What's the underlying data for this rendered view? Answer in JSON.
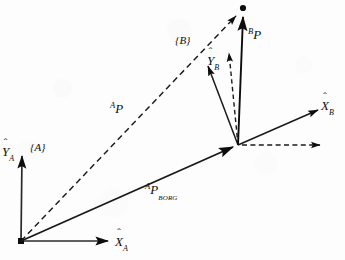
{
  "figure": {
    "background_color": "#fdfdfd",
    "ink_color": "#0d0d0d",
    "width": 345,
    "height": 260
  },
  "frames": {
    "A": {
      "tag": "{A}",
      "origin": {
        "x": 21,
        "y": 241
      },
      "x_axis": {
        "symbol": "X",
        "hat": "̂",
        "subscript": "A",
        "tip": {
          "x": 112,
          "y": 241
        },
        "label_pos": {
          "x": 116,
          "y": 234
        }
      },
      "y_axis": {
        "symbol": "Y",
        "hat": "̂",
        "subscript": "A",
        "tip": {
          "x": 22,
          "y": 152
        },
        "label_pos": {
          "x": 3,
          "y": 150
        }
      },
      "tag_pos": {
        "x": 30,
        "y": 148
      }
    },
    "B": {
      "tag": "{B}",
      "origin": {
        "x": 238,
        "y": 145
      },
      "x_axis": {
        "symbol": "X",
        "hat": "̂",
        "subscript": "B",
        "tip": {
          "x": 322,
          "y": 108
        },
        "label_pos": {
          "x": 322,
          "y": 98
        }
      },
      "y_axis": {
        "symbol": "Y",
        "hat": "̂",
        "subscript": "B",
        "tip": {
          "x": 206,
          "y": 62
        },
        "label_pos": {
          "x": 208,
          "y": 54
        }
      },
      "tag_pos": {
        "x": 176,
        "y": 36
      }
    }
  },
  "point_p": {
    "name": "P",
    "pos": {
      "x": 243,
      "y": 8
    },
    "marker": "filled-dot"
  },
  "vectors": [
    {
      "id": "A_P",
      "style": "dashed",
      "presuperscript": "A",
      "symbol": "P",
      "subscript": "",
      "from": {
        "x": 21,
        "y": 241
      },
      "to": {
        "x": 240,
        "y": 12
      },
      "label_pos": {
        "x": 112,
        "y": 103
      }
    },
    {
      "id": "B_P",
      "style": "solid",
      "presuperscript": "B",
      "symbol": "P",
      "subscript": "",
      "from": {
        "x": 238,
        "y": 145
      },
      "to": {
        "x": 244,
        "y": 13
      },
      "label_pos": {
        "x": 249,
        "y": 29
      }
    },
    {
      "id": "A_P_BORG",
      "style": "solid",
      "presuperscript": "A",
      "symbol": "P",
      "subscript": "BORG",
      "from": {
        "x": 21,
        "y": 241
      },
      "to": {
        "x": 238,
        "y": 145
      },
      "label_pos": {
        "x": 146,
        "y": 184
      }
    }
  ],
  "reference_lines": [
    {
      "id": "horizontal-reference",
      "style": "dashed",
      "arrow": true,
      "from": {
        "x": 240,
        "y": 145
      },
      "to": {
        "x": 325,
        "y": 145
      }
    },
    {
      "id": "vertical-reference",
      "style": "dashed",
      "arrow": true,
      "from": {
        "x": 238,
        "y": 145
      },
      "to": {
        "x": 228,
        "y": 48
      }
    }
  ],
  "labels": {
    "frame_a_tag": "{A}",
    "frame_b_tag": "{B}",
    "x_a": "X",
    "y_a": "Y",
    "x_b": "X",
    "y_b": "Y",
    "sub_a": "A",
    "sub_b": "B",
    "hat": "̂",
    "p_symbol": "P",
    "sup_a": "A",
    "sup_b": "B",
    "sub_borg": "BORG"
  }
}
